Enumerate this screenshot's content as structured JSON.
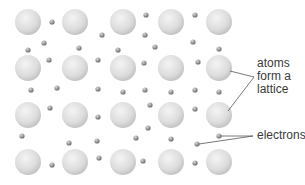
{
  "diagram": {
    "type": "metallic-bonding-lattice",
    "colors": {
      "background": "#ffffff",
      "atom_light": "#f2f2f2",
      "atom_dark": "#c4c4c4",
      "electron_light": "#cfcfcf",
      "electron_dark": "#6e6e6e",
      "leader_line": "#555555",
      "label_text": "#3a3a3a"
    },
    "atoms": {
      "radius": 13,
      "columns_x": [
        28,
        75,
        123,
        171,
        219
      ],
      "rows_y": [
        22,
        68,
        115,
        162
      ]
    },
    "electrons": {
      "radius": 2.6,
      "points": [
        [
          52,
          22
        ],
        [
          146,
          15
        ],
        [
          195,
          15
        ],
        [
          102,
          35
        ],
        [
          44,
          43
        ],
        [
          28,
          50
        ],
        [
          79,
          48
        ],
        [
          118,
          50
        ],
        [
          145,
          35
        ],
        [
          155,
          47
        ],
        [
          193,
          42
        ],
        [
          219,
          49
        ],
        [
          49,
          60
        ],
        [
          98,
          60
        ],
        [
          144,
          63
        ],
        [
          198,
          62
        ],
        [
          31,
          90
        ],
        [
          57,
          88
        ],
        [
          98,
          89
        ],
        [
          123,
          92
        ],
        [
          145,
          90
        ],
        [
          171,
          92
        ],
        [
          195,
          90
        ],
        [
          219,
          92
        ],
        [
          50,
          108
        ],
        [
          98,
          117
        ],
        [
          150,
          105
        ],
        [
          195,
          109
        ],
        [
          22,
          136
        ],
        [
          69,
          143
        ],
        [
          97,
          141
        ],
        [
          136,
          138
        ],
        [
          171,
          139
        ],
        [
          148,
          128
        ],
        [
          197,
          144
        ],
        [
          219,
          136
        ],
        [
          52,
          165
        ],
        [
          99,
          158
        ],
        [
          143,
          161
        ],
        [
          195,
          163
        ]
      ]
    },
    "labels": {
      "atoms": {
        "lines": [
          "atoms",
          "form a",
          "lattice"
        ],
        "leader_origin": [
          254,
          77
        ],
        "leader_targets": [
          [
            230,
            71
          ],
          [
            228,
            111
          ]
        ]
      },
      "electrons": {
        "text": "electrons",
        "leader_origin": [
          253,
          136
        ],
        "leader_targets": [
          [
            221,
            136
          ],
          [
            199,
            144
          ]
        ]
      }
    }
  }
}
